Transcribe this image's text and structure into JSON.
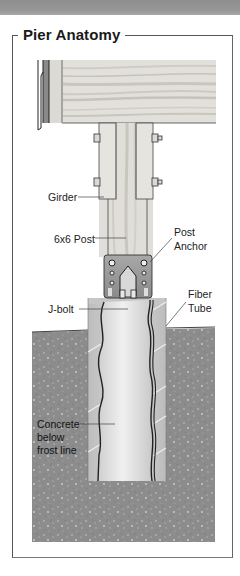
{
  "title": "Pier Anatomy",
  "labels": {
    "girder": "Girder",
    "post": "6x6 Post",
    "post_anchor_line1": "Post",
    "post_anchor_line2": "Anchor",
    "j_bolt": "J-bolt",
    "fiber_tube_line1": "Fiber",
    "fiber_tube_line2": "Tube",
    "concrete_line1": "Concrete",
    "concrete_line2": "below",
    "concrete_line3": "frost line"
  },
  "colors": {
    "wood": "#e4e2dc",
    "wood_grain": "#c9c6bf",
    "soil": "#8a8a8a",
    "tube": "#cfcfcf",
    "concrete": "#e6e6e6",
    "anchor": "#9a9a9a",
    "frame": "#555555"
  }
}
